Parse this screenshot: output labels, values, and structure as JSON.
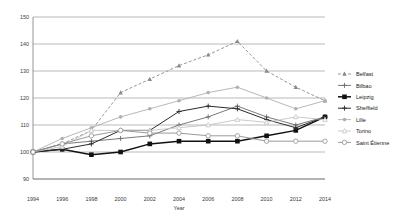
{
  "chart_data": {
    "type": "line",
    "title": "",
    "xlabel": "Year",
    "ylabel": "",
    "x": [
      1994,
      1996,
      1998,
      2000,
      2002,
      2004,
      2006,
      2008,
      2010,
      2012,
      2014
    ],
    "xticklabels": [
      "1994",
      "1996",
      "1998",
      "2000",
      "2002",
      "2004",
      "2006",
      "2008",
      "2010",
      "2012",
      "2014"
    ],
    "yticks": [
      90,
      100,
      110,
      120,
      130,
      140,
      150
    ],
    "yticklabels": [
      "90",
      "100",
      "110",
      "120",
      "130",
      "140",
      "150"
    ],
    "ylim": [
      90,
      150
    ],
    "xlim": [
      1994,
      2014
    ],
    "grid": true,
    "legend_position": "right",
    "series": [
      {
        "name": "Belfast",
        "color": "#8a8a8a",
        "marker": "triangle",
        "dash": "3,2",
        "width": 0.9,
        "values": [
          100,
          103,
          108,
          122,
          127,
          132,
          136,
          141,
          130,
          124,
          119
        ]
      },
      {
        "name": "Bilbao",
        "color": "#6b6b6b",
        "marker": "plus",
        "dash": "none",
        "width": 0.9,
        "values": [
          100,
          103,
          104,
          105,
          106,
          110,
          113,
          117,
          113,
          110,
          113
        ]
      },
      {
        "name": "Leipzig",
        "color": "#111111",
        "marker": "square-filled",
        "dash": "none",
        "width": 1.5,
        "values": [
          100,
          101,
          99,
          100,
          103,
          104,
          104,
          104,
          106,
          108,
          113
        ]
      },
      {
        "name": "Sheffield",
        "color": "#2b2b2b",
        "marker": "plus",
        "dash": "none",
        "width": 1.0,
        "values": [
          100,
          101,
          103,
          108,
          108,
          115,
          117,
          116,
          112,
          109,
          113
        ]
      },
      {
        "name": "Lille",
        "color": "#b0b0b0",
        "marker": "circle-filled",
        "dash": "none",
        "width": 0.9,
        "values": [
          100,
          105,
          109,
          113,
          116,
          119,
          122,
          124,
          120,
          116,
          119
        ]
      },
      {
        "name": "Torino",
        "color": "#c4c4c4",
        "marker": "triangle-open",
        "dash": "none",
        "width": 0.9,
        "values": [
          100,
          102,
          108,
          108,
          108,
          109,
          110,
          112,
          111,
          113,
          112
        ]
      },
      {
        "name": "Saint Étienne",
        "color": "#8f8f8f",
        "marker": "circle-open",
        "dash": "none",
        "width": 0.9,
        "values": [
          100,
          103,
          106,
          108,
          107,
          107,
          106,
          106,
          104,
          104,
          104
        ]
      }
    ]
  }
}
